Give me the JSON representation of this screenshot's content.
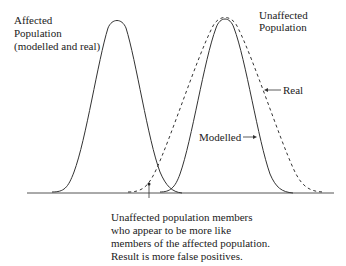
{
  "diagram": {
    "labels": {
      "affected_line1": "Affected",
      "affected_line2": "Population",
      "affected_line3": "(modelled and real)",
      "unaffected_line1": "Unaffected",
      "unaffected_line2": "Population",
      "real": "Real",
      "modelled": "Modelled"
    },
    "caption": {
      "line1": "Unaffected population members",
      "line2": "who appear to be more like",
      "line3": "members of the affected population.",
      "line4": "Result is more false positives."
    },
    "curves": [
      {
        "name": "Affected Population (modelled and real)",
        "style": "solid",
        "peak_x": 117,
        "spread": 19
      },
      {
        "name": "Unaffected Population - Modelled",
        "style": "solid",
        "peak_x": 225,
        "spread": 19
      },
      {
        "name": "Unaffected Population - Real",
        "style": "dashed",
        "peak_x": 225,
        "spread": 28
      }
    ]
  }
}
